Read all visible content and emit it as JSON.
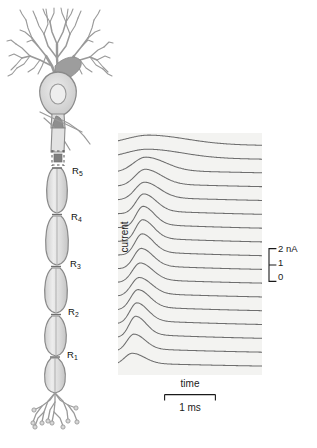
{
  "figure": {
    "type": "scientific-illustration"
  },
  "neuron": {
    "description": "Myelinated neuron with dendritic arbor, soma, myelinated axon with nodes of Ranvier, and axon terminal arborization",
    "node_labels": [
      {
        "id": "R5",
        "text": "R",
        "sub": "5",
        "x": 72,
        "y": 172
      },
      {
        "id": "R4",
        "text": "R",
        "sub": "4",
        "x": 70,
        "y": 215
      },
      {
        "id": "R3",
        "text": "R",
        "sub": "3",
        "x": 68,
        "y": 262
      },
      {
        "id": "R2",
        "text": "R",
        "sub": "2",
        "x": 66,
        "y": 310
      },
      {
        "id": "R1",
        "text": "R",
        "sub": "1",
        "x": 66,
        "y": 352
      }
    ]
  },
  "axes": {
    "current_label": "current",
    "time_label": "time",
    "time_scale_value": "1 ms",
    "current_ticks": [
      "2 nA",
      "1",
      "0"
    ]
  },
  "chart_data": {
    "type": "line",
    "title": "",
    "subtitle": "",
    "xlabel": "time",
    "ylabel": "current",
    "xlim": [
      0,
      1
    ],
    "ylim": [
      0,
      2
    ],
    "x_units": "ms",
    "y_units": "nA",
    "x_scalebar": {
      "label": "1 ms",
      "value": 1,
      "units": "ms"
    },
    "y_scalebar": {
      "labels": [
        "2 nA",
        "1",
        "0"
      ],
      "values": [
        2,
        1,
        0
      ],
      "units": "nA"
    },
    "grid": false,
    "legend": null,
    "annotations": [],
    "series_description": "Stacked sodium current traces recorded at successive positions along the axon; traces near the soma (top) are broad and delayed, traces near the terminal (bottom) are sharp and early, illustrating saltatory conduction.",
    "series": [
      {
        "name": "trace-01",
        "peak_time": 0.22,
        "peak_amplitude": 0.62,
        "width": 0.3,
        "baseline": 0.0
      },
      {
        "name": "trace-02",
        "peak_time": 0.21,
        "peak_amplitude": 0.6,
        "width": 0.28,
        "baseline": 0.0
      },
      {
        "name": "trace-03",
        "peak_time": 0.195,
        "peak_amplitude": 0.95,
        "width": 0.16,
        "baseline": 0.0
      },
      {
        "name": "trace-04",
        "peak_time": 0.19,
        "peak_amplitude": 1.05,
        "width": 0.13,
        "baseline": 0.0
      },
      {
        "name": "trace-05",
        "peak_time": 0.185,
        "peak_amplitude": 1.1,
        "width": 0.12,
        "baseline": 0.0
      },
      {
        "name": "trace-06",
        "peak_time": 0.18,
        "peak_amplitude": 1.22,
        "width": 0.1,
        "baseline": 0.0
      },
      {
        "name": "trace-07",
        "peak_time": 0.175,
        "peak_amplitude": 1.3,
        "width": 0.09,
        "baseline": 0.0
      },
      {
        "name": "trace-08",
        "peak_time": 0.172,
        "peak_amplitude": 1.32,
        "width": 0.09,
        "baseline": 0.0
      },
      {
        "name": "trace-09",
        "peak_time": 0.168,
        "peak_amplitude": 1.3,
        "width": 0.09,
        "baseline": 0.0
      },
      {
        "name": "trace-10",
        "peak_time": 0.162,
        "peak_amplitude": 1.25,
        "width": 0.095,
        "baseline": 0.0
      },
      {
        "name": "trace-11",
        "peak_time": 0.155,
        "peak_amplitude": 1.2,
        "width": 0.1,
        "baseline": 0.0
      },
      {
        "name": "trace-12",
        "peak_time": 0.148,
        "peak_amplitude": 1.15,
        "width": 0.1,
        "baseline": 0.0
      },
      {
        "name": "trace-13",
        "peak_time": 0.14,
        "peak_amplitude": 1.25,
        "width": 0.095,
        "baseline": 0.0
      },
      {
        "name": "trace-14",
        "peak_time": 0.132,
        "peak_amplitude": 1.28,
        "width": 0.09,
        "baseline": 0.0
      },
      {
        "name": "trace-15",
        "peak_time": 0.124,
        "peak_amplitude": 1.3,
        "width": 0.085,
        "baseline": 0.0
      },
      {
        "name": "trace-16",
        "peak_time": 0.112,
        "peak_amplitude": 1.05,
        "width": 0.09,
        "baseline": 0.0
      },
      {
        "name": "trace-17",
        "peak_time": 0.1,
        "peak_amplitude": 0.72,
        "width": 0.1,
        "baseline": 0.0
      }
    ]
  },
  "colors": {
    "panel_background": "#f3f3f1",
    "trace_line": "#6e6e6e",
    "neuron_outline": "#8a8a8a",
    "neuron_fill": "#dcdcdc",
    "soma_shade": "#9a9a9a",
    "text": "#1a1a1a",
    "page_background": "#ffffff"
  }
}
